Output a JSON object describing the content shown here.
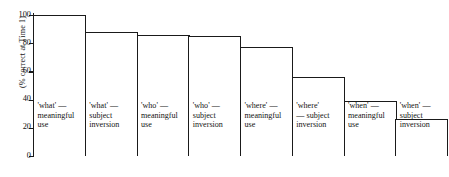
{
  "chart_data": {
    "type": "bar",
    "title": "",
    "xlabel": "",
    "ylabel": "(% correct at Time 1)",
    "ylim": [
      0,
      100
    ],
    "grid": false,
    "legend": "none",
    "yticks": [
      0,
      20,
      40,
      60,
      80,
      100
    ],
    "ytick_labels": [
      "0",
      "20",
      "40",
      "60",
      "80",
      "100"
    ],
    "categories": [
      "'what' — meaningful use",
      "'what' — subject inversion",
      "'who' — meaningful use",
      "'who' — subject inversion",
      "'where' — meaningful use",
      "'where' — subject inversion",
      "'when' — meaningful use",
      "'when' — subject inversion"
    ],
    "values": [
      100,
      88,
      86,
      85,
      77,
      56,
      39,
      26
    ],
    "bars": [
      {
        "label_line1": "'what' —",
        "label_line2": "meaningful",
        "label_line3": "use",
        "value": 100
      },
      {
        "label_line1": "'what' —",
        "label_line2": "subject",
        "label_line3": "inversion",
        "value": 88
      },
      {
        "label_line1": "'who' —",
        "label_line2": "meaningful",
        "label_line3": "use",
        "value": 86
      },
      {
        "label_line1": "'who' —",
        "label_line2": "subject",
        "label_line3": "inversion",
        "value": 85
      },
      {
        "label_line1": "'where' —",
        "label_line2": "meaningful",
        "label_line3": "use",
        "value": 77
      },
      {
        "label_line1": "'where'",
        "label_line2": "— subject",
        "label_line3": "inversion",
        "value": 56
      },
      {
        "label_line1": "'when' —",
        "label_line2": "meaningful",
        "label_line3": "use",
        "value": 39
      },
      {
        "label_line1": "'when' —",
        "label_line2": "subject",
        "label_line3": "inversion",
        "value": 26
      }
    ],
    "colors": {
      "bar_fill": "#ffffff",
      "bar_stroke": "#1a1a1a",
      "axis": "#1a1a1a",
      "text": "#111111",
      "background": "#ffffff"
    }
  }
}
